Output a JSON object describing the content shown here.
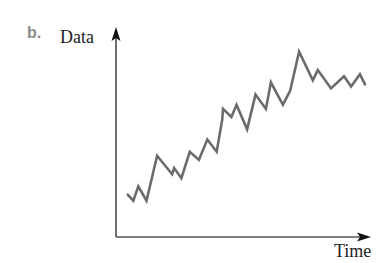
{
  "figure": {
    "panel_label": "b.",
    "ylabel": "Data",
    "xlabel": "Time"
  },
  "chart_data": {
    "type": "line",
    "title": "",
    "panel_label": "b.",
    "xlabel": "Time",
    "ylabel": "Data",
    "grid": false,
    "legend": null,
    "axis_ticks": "none",
    "axes_style": "arrows",
    "line_color": "#6b6b6b",
    "x": [
      0,
      2.2,
      4.2,
      7.4,
      11.6,
      17.5,
      18.3,
      21.2,
      24.5,
      28.1,
      31.4,
      35.1,
      37.3,
      37.6,
      40.9,
      42.9,
      47.1,
      50.4,
      54.5,
      56.5,
      61.2,
      64.1,
      67.6,
      73.0,
      75.0,
      80.2,
      85.3,
      88.1,
      91.6,
      93.6
    ],
    "values": [
      24,
      21,
      28,
      21,
      43,
      34,
      37,
      32,
      45,
      41,
      51,
      45,
      61,
      66,
      62,
      68,
      56,
      73,
      66,
      79,
      68,
      75,
      94,
      80,
      85,
      76,
      82,
      77,
      83,
      78
    ],
    "xlim": [
      0,
      100
    ],
    "ylim": [
      0,
      100
    ]
  }
}
